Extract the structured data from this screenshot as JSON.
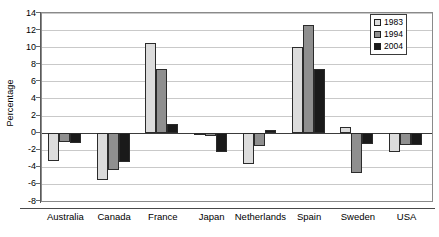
{
  "chart_data": {
    "type": "bar",
    "title": "",
    "xlabel": "",
    "ylabel": "Percentage",
    "ylim": [
      -8,
      14
    ],
    "ytick_step": 2,
    "yticks": [
      14,
      12,
      10,
      8,
      6,
      4,
      2,
      0,
      -2,
      -4,
      -6,
      -8
    ],
    "ytick_labels": [
      "14",
      "12",
      "10",
      "8",
      "6",
      "4",
      "2",
      "0",
      "-2",
      "-4",
      "-6",
      "-8"
    ],
    "grid": true,
    "grid_axis": "y",
    "legend_position": "top-right",
    "categories": [
      "Australia",
      "Canada",
      "France",
      "Japan",
      "Netherlands",
      "Spain",
      "Sweden",
      "USA"
    ],
    "series": [
      {
        "name": "1983",
        "color": "#dcdcdc",
        "values": [
          -3.3,
          -5.5,
          10.5,
          -0.2,
          -3.7,
          10.0,
          0.7,
          -2.3
        ]
      },
      {
        "name": "1994",
        "color": "#8f8f8f",
        "values": [
          -1.1,
          -4.4,
          7.4,
          -0.4,
          -1.6,
          12.6,
          -4.7,
          -1.5
        ]
      },
      {
        "name": "2004",
        "color": "#1a1a1a",
        "values": [
          -1.2,
          -3.4,
          1.0,
          -2.3,
          0.3,
          7.4,
          -1.3,
          -1.5
        ]
      }
    ]
  },
  "legend": {
    "items": [
      {
        "label": "1983",
        "swatch": "legend-swatch-1983"
      },
      {
        "label": "1994",
        "swatch": "legend-swatch-1994"
      },
      {
        "label": "2004",
        "swatch": "legend-swatch-2004"
      }
    ]
  },
  "axis": {
    "y_title": "Percentage"
  }
}
